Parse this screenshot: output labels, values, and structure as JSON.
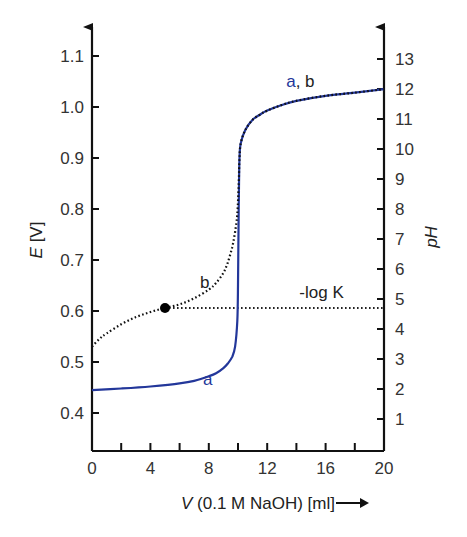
{
  "chart_data": {
    "type": "line",
    "title": "",
    "xlabel": "V (0.1 M NaOH) [ml]",
    "xlabel_italic_part": "V",
    "xlabel_rest": " (0.1 M NaOH) [ml]",
    "ylabel": "E [V]",
    "ylabel_italic_part": "E",
    "ylabel_rest": " [V]",
    "y2label": "pH",
    "xlim": [
      0,
      20
    ],
    "ylim": [
      0.33,
      1.15
    ],
    "y2lim": [
      0,
      14
    ],
    "grid": false,
    "legend": "none (inline curve labels)",
    "x_ticks": [
      0,
      2,
      4,
      6,
      8,
      10,
      12,
      14,
      16,
      18,
      20
    ],
    "x_tick_labels": [
      "0",
      "4",
      "8",
      "12",
      "16",
      "20"
    ],
    "x_tick_label_values": [
      0,
      4,
      8,
      12,
      16,
      20
    ],
    "y_ticks": [
      0.4,
      0.5,
      0.6,
      0.7,
      0.8,
      0.9,
      1.0,
      1.1
    ],
    "y_tick_labels": [
      "0.4",
      "0.5",
      "0.6",
      "0.7",
      "0.8",
      "0.9",
      "1.0",
      "1.1"
    ],
    "y2_ticks": [
      1,
      2,
      3,
      4,
      5,
      6,
      7,
      8,
      9,
      10,
      11,
      12,
      13
    ],
    "y2_tick_labels": [
      "1",
      "2",
      "3",
      "4",
      "5",
      "6",
      "7",
      "8",
      "9",
      "10",
      "11",
      "12",
      "13"
    ],
    "series": [
      {
        "name": "a",
        "style": "solid",
        "color": "#23379a",
        "x": [
          0,
          2,
          4,
          6,
          7,
          8,
          8.5,
          9,
          9.3,
          9.6,
          9.8,
          9.95,
          10.0,
          10.05,
          10.1,
          10.2,
          10.5,
          11,
          11.5,
          12,
          13,
          14,
          16,
          18,
          20
        ],
        "y": [
          0.445,
          0.448,
          0.452,
          0.458,
          0.463,
          0.472,
          0.478,
          0.488,
          0.497,
          0.51,
          0.53,
          0.58,
          0.65,
          0.8,
          0.9,
          0.93,
          0.955,
          0.975,
          0.985,
          0.993,
          1.004,
          1.012,
          1.022,
          1.028,
          1.035
        ]
      },
      {
        "name": "b",
        "style": "dotted",
        "color": "#111111",
        "x": [
          0,
          0.5,
          1,
          2,
          3,
          4,
          5,
          6,
          7,
          8,
          8.5,
          9,
          9.3,
          9.6,
          9.8,
          9.95,
          10.05,
          10.1,
          10.2,
          10.5,
          11,
          11.5,
          12,
          13,
          14,
          16,
          18,
          20
        ],
        "y": [
          0.53,
          0.545,
          0.556,
          0.574,
          0.588,
          0.598,
          0.606,
          0.613,
          0.625,
          0.642,
          0.655,
          0.675,
          0.695,
          0.725,
          0.755,
          0.79,
          0.85,
          0.9,
          0.93,
          0.955,
          0.975,
          0.985,
          0.993,
          1.004,
          1.012,
          1.022,
          1.028,
          1.035
        ]
      }
    ],
    "annotations": [
      {
        "text": "a, b",
        "x": 13.3,
        "y": 1.04,
        "parts": [
          {
            "text": "a",
            "color": "#23379a"
          },
          {
            "text": ", b",
            "color": "#222222"
          }
        ]
      },
      {
        "text": "b",
        "x": 7.4,
        "y": 0.645,
        "color": "#222222"
      },
      {
        "text": "a",
        "x": 7.6,
        "y": 0.455,
        "color": "#23379a"
      },
      {
        "text": "-log K",
        "x": 14.2,
        "y": 0.625,
        "color": "#222222"
      }
    ],
    "marker_point": {
      "x": 5.0,
      "y": 0.606,
      "label": "half-equivalence point"
    },
    "reference_line": {
      "label": "-log K",
      "y": 0.606,
      "pH": 4.7,
      "x_from": 5.0,
      "x_to": 20,
      "style": "dotted"
    }
  },
  "colors": {
    "curve_a": "#23379a",
    "curve_b": "#111111",
    "axis": "#111111",
    "text": "#333333"
  }
}
